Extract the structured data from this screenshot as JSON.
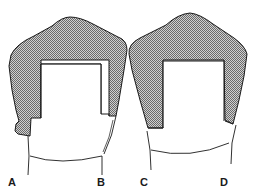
{
  "figure": {
    "type": "dental crown cross-section diagram",
    "colors": {
      "outline": "#1a1a1a",
      "shading": "#9a9a9a",
      "background": "#ffffff"
    },
    "panels": [
      {
        "id": "left",
        "description": "crown with preparation, uneven margins"
      },
      {
        "id": "right",
        "description": "crown with preparation, shouldered margins"
      }
    ],
    "labels": [
      {
        "id": "A",
        "text": "A"
      },
      {
        "id": "B",
        "text": "B"
      },
      {
        "id": "C",
        "text": "C"
      },
      {
        "id": "D",
        "text": "D"
      }
    ]
  }
}
